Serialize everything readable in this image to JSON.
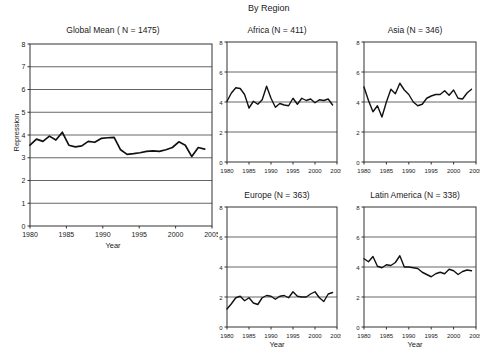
{
  "figure": {
    "region_header": "By Region",
    "axis_x_label": "Year",
    "axis_y_label": "Repression"
  },
  "chart_data": [
    {
      "type": "line",
      "id": "global-mean",
      "title": "Global Mean ( N = 1475)",
      "xlabel": "Year",
      "ylabel": "Repression",
      "xlim": [
        1980,
        2005
      ],
      "ylim": [
        0,
        8
      ],
      "xticks": [
        1980,
        1985,
        1990,
        1995,
        2000,
        2005
      ],
      "yticks": [
        0,
        1,
        2,
        3,
        4,
        5,
        6,
        7,
        8
      ],
      "grid": true,
      "legend": "none",
      "x": [
        1980,
        1981,
        1982,
        1983,
        1984,
        1985,
        1986,
        1987,
        1988,
        1989,
        1990,
        1991,
        1992,
        1993,
        1994,
        1995,
        1996,
        1997,
        1998,
        1999,
        2000,
        2001,
        2002,
        2003,
        2004
      ],
      "values": [
        3.55,
        3.82,
        3.72,
        3.95,
        3.78,
        4.12,
        3.55,
        3.48,
        3.52,
        3.72,
        3.68,
        3.85,
        3.88,
        3.9,
        3.35,
        3.15,
        3.18,
        3.22,
        3.28,
        3.3,
        3.28,
        3.35,
        3.45,
        3.7,
        3.55,
        3.05,
        3.45,
        3.38
      ]
    },
    {
      "type": "line",
      "id": "africa",
      "title": "Africa (N = 411)",
      "xlabel": "Year",
      "ylabel": "",
      "xlim": [
        1980,
        2005
      ],
      "ylim": [
        0,
        8
      ],
      "xticks": [
        1980,
        1985,
        1990,
        1995,
        2000,
        2005
      ],
      "yticks": [
        0,
        2,
        4,
        6,
        8
      ],
      "grid": true,
      "legend": "none",
      "x": [
        1980,
        1981,
        1982,
        1983,
        1984,
        1985,
        1986,
        1987,
        1988,
        1989,
        1990,
        1991,
        1992,
        1993,
        1994,
        1995,
        1996,
        1997,
        1998,
        1999,
        2000,
        2001,
        2002,
        2003,
        2004
      ],
      "values": [
        4.05,
        4.6,
        4.95,
        4.9,
        4.5,
        3.6,
        4.05,
        3.85,
        4.15,
        5.05,
        4.25,
        3.65,
        3.9,
        3.8,
        3.75,
        4.25,
        3.85,
        4.25,
        4.1,
        4.2,
        3.95,
        4.15,
        4.1,
        4.2,
        3.8
      ]
    },
    {
      "type": "line",
      "id": "asia",
      "title": "Asia (N = 346)",
      "xlabel": "Year",
      "ylabel": "",
      "xlim": [
        1980,
        2005
      ],
      "ylim": [
        0,
        8
      ],
      "xticks": [
        1980,
        1985,
        1990,
        1995,
        2000,
        2005
      ],
      "yticks": [
        0,
        2,
        4,
        6,
        8
      ],
      "grid": true,
      "legend": "none",
      "x": [
        1980,
        1981,
        1982,
        1983,
        1984,
        1985,
        1986,
        1987,
        1988,
        1989,
        1990,
        1991,
        1992,
        1993,
        1994,
        1995,
        1996,
        1997,
        1998,
        1999,
        2000,
        2001,
        2002,
        2003,
        2004
      ],
      "values": [
        5.0,
        4.1,
        3.35,
        3.75,
        3.0,
        4.0,
        4.85,
        4.55,
        5.25,
        4.8,
        4.5,
        4.0,
        3.75,
        3.85,
        4.25,
        4.4,
        4.5,
        4.5,
        4.75,
        4.45,
        4.8,
        4.25,
        4.2,
        4.6,
        4.85
      ]
    },
    {
      "type": "line",
      "id": "europe",
      "title": "Europe (N = 363)",
      "xlabel": "Year",
      "ylabel": "",
      "xlim": [
        1980,
        2005
      ],
      "ylim": [
        0,
        8
      ],
      "xticks": [
        1980,
        1985,
        1990,
        1995,
        2000,
        2005
      ],
      "yticks": [
        0,
        2,
        4,
        6,
        8
      ],
      "grid": true,
      "legend": "none",
      "x": [
        1980,
        1981,
        1982,
        1983,
        1984,
        1985,
        1986,
        1987,
        1988,
        1989,
        1990,
        1991,
        1992,
        1993,
        1994,
        1995,
        1996,
        1997,
        1998,
        1999,
        2000,
        2001,
        2002,
        2003,
        2004
      ],
      "values": [
        1.2,
        1.55,
        1.95,
        2.05,
        1.75,
        1.95,
        1.6,
        1.5,
        1.95,
        2.1,
        2.05,
        1.85,
        2.05,
        2.1,
        1.95,
        2.35,
        2.05,
        2.0,
        2.0,
        2.2,
        2.35,
        1.95,
        1.7,
        2.2,
        2.3
      ]
    },
    {
      "type": "line",
      "id": "latin-america",
      "title": "Latin America (N = 338)",
      "xlabel": "Year",
      "ylabel": "",
      "xlim": [
        1980,
        2005
      ],
      "ylim": [
        0,
        8
      ],
      "xticks": [
        1980,
        1985,
        1990,
        1995,
        2000,
        2005
      ],
      "yticks": [
        0,
        2,
        4,
        6,
        8
      ],
      "grid": true,
      "legend": "none",
      "x": [
        1980,
        1981,
        1982,
        1983,
        1984,
        1985,
        1986,
        1987,
        1988,
        1989,
        1990,
        1991,
        1992,
        1993,
        1994,
        1995,
        1996,
        1997,
        1998,
        1999,
        2000,
        2001,
        2002,
        2003,
        2004
      ],
      "values": [
        4.55,
        4.35,
        4.7,
        4.05,
        3.95,
        4.15,
        4.1,
        4.3,
        4.75,
        4.0,
        4.0,
        3.95,
        3.9,
        3.65,
        3.5,
        3.35,
        3.55,
        3.65,
        3.55,
        3.85,
        3.75,
        3.5,
        3.7,
        3.8,
        3.75
      ]
    }
  ],
  "panels": {
    "global": {
      "title": "Global Mean ( N = 1475)"
    },
    "africa": {
      "title": "Africa (N = 411)"
    },
    "asia": {
      "title": "Asia (N = 346)"
    },
    "europe": {
      "title": "Europe (N = 363)"
    },
    "latin_america": {
      "title": "Latin America (N = 338)"
    }
  }
}
